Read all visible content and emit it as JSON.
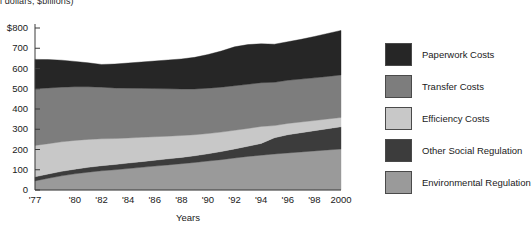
{
  "caption": {
    "text": "l dollars, $billions)"
  },
  "chart_data": {
    "type": "area",
    "stacked": true,
    "title": "",
    "subtitle": "",
    "xlabel": "Years",
    "ylabel": "",
    "ylim": [
      0,
      800
    ],
    "xlim": [
      1977,
      2000
    ],
    "grid": false,
    "legend_position": "right",
    "yticks": [
      0,
      100,
      200,
      300,
      400,
      500,
      600,
      700,
      800
    ],
    "ytick_labels": [
      "0",
      "100",
      "200",
      "300",
      "400",
      "500",
      "600",
      "700",
      "$800"
    ],
    "xticks": [
      1977,
      1980,
      1982,
      1984,
      1986,
      1988,
      1990,
      1992,
      1994,
      1996,
      1998,
      2000
    ],
    "xtick_labels": [
      "'77",
      "'80",
      "'82",
      "'84",
      "'86",
      "'88",
      "'90",
      "'92",
      "'94",
      "'96",
      "'98",
      "2000"
    ],
    "x": [
      1977,
      1978,
      1979,
      1980,
      1981,
      1982,
      1983,
      1984,
      1985,
      1986,
      1987,
      1988,
      1989,
      1990,
      1991,
      1992,
      1993,
      1994,
      1995,
      1996,
      1997,
      1998,
      1999,
      2000
    ],
    "series": [
      {
        "name": "Environmental Regulation",
        "color": "#9a9a9a",
        "order": 1,
        "values": [
          45,
          58,
          70,
          80,
          88,
          95,
          100,
          106,
          112,
          118,
          124,
          130,
          136,
          143,
          150,
          158,
          166,
          172,
          178,
          183,
          188,
          193,
          198,
          202
        ]
      },
      {
        "name": "Other Social Regulation",
        "color": "#3c3c3c",
        "order": 2,
        "values": [
          20,
          21,
          22,
          23,
          24,
          25,
          26,
          27,
          28,
          29,
          30,
          31,
          33,
          36,
          40,
          45,
          50,
          58,
          80,
          90,
          95,
          100,
          105,
          110
        ]
      },
      {
        "name": "Efficiency Costs",
        "color": "#c8c8c8",
        "order": 3,
        "values": [
          155,
          150,
          146,
          142,
          138,
          133,
          128,
          124,
          120,
          116,
          112,
          108,
          104,
          100,
          96,
          92,
          88,
          84,
          60,
          56,
          53,
          50,
          48,
          46
        ]
      },
      {
        "name": "Transfer Costs",
        "color": "#7d7d7d",
        "order": 4,
        "values": [
          280,
          275,
          270,
          265,
          260,
          255,
          250,
          246,
          242,
          238,
          234,
          230,
          226,
          224,
          222,
          220,
          218,
          216,
          214,
          213,
          212,
          211,
          210,
          210
        ]
      },
      {
        "name": "Paperwork Costs",
        "color": "#262626",
        "order": 5,
        "values": [
          145,
          140,
          133,
          125,
          118,
          112,
          118,
          124,
          130,
          136,
          142,
          148,
          156,
          166,
          178,
          192,
          196,
          192,
          188,
          190,
          196,
          204,
          212,
          220
        ]
      }
    ],
    "totals": [
      645,
      644,
      641,
      635,
      628,
      620,
      622,
      627,
      632,
      637,
      642,
      647,
      655,
      669,
      686,
      707,
      718,
      722,
      720,
      732,
      744,
      758,
      773,
      788
    ]
  },
  "legend": {
    "items": [
      {
        "label": "Paperwork Costs",
        "color": "#262626"
      },
      {
        "label": "Transfer Costs",
        "color": "#7d7d7d"
      },
      {
        "label": "Efficiency Costs",
        "color": "#c8c8c8"
      },
      {
        "label": "Other Social Regulation",
        "color": "#3c3c3c"
      },
      {
        "label": "Environmental Regulation",
        "color": "#9a9a9a"
      }
    ]
  }
}
